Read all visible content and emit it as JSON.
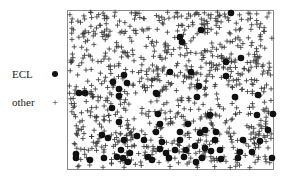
{
  "chart_data": {
    "type": "scatter",
    "title": "",
    "xlabel": "",
    "ylabel": "",
    "grid": false,
    "legend_position": "left",
    "plot_box": {
      "left": 67,
      "top": 10,
      "right": 274,
      "bottom": 170
    },
    "series": [
      {
        "name": "ECL",
        "marker": "filled-circle",
        "color": "#111111",
        "points": [
          [
            231,
            13
          ],
          [
            201,
            30
          ],
          [
            180,
            37
          ],
          [
            182,
            42
          ],
          [
            241,
            58
          ],
          [
            226,
            62
          ],
          [
            191,
            72
          ],
          [
            170,
            72
          ],
          [
            226,
            76
          ],
          [
            124,
            75
          ],
          [
            113,
            82
          ],
          [
            127,
            83
          ],
          [
            199,
            86
          ],
          [
            119,
            89
          ],
          [
            79,
            93
          ],
          [
            85,
            93
          ],
          [
            156,
            93
          ],
          [
            119,
            96
          ],
          [
            157,
            94
          ],
          [
            197,
            97
          ],
          [
            235,
            97
          ],
          [
            258,
            95
          ],
          [
            273,
            114
          ],
          [
            112,
            108
          ],
          [
            158,
            114
          ],
          [
            210,
            115
          ],
          [
            257,
            115
          ],
          [
            119,
            122
          ],
          [
            160,
            124
          ],
          [
            188,
            124
          ],
          [
            268,
            130
          ],
          [
            102,
            135
          ],
          [
            108,
            138
          ],
          [
            137,
            136
          ],
          [
            156,
            132
          ],
          [
            180,
            132
          ],
          [
            200,
            133
          ],
          [
            205,
            130
          ],
          [
            216,
            132
          ],
          [
            124,
            140
          ],
          [
            144,
            140
          ],
          [
            162,
            142
          ],
          [
            180,
            140
          ],
          [
            215,
            140
          ],
          [
            243,
            140
          ],
          [
            260,
            141
          ],
          [
            121,
            150
          ],
          [
            130,
            153
          ],
          [
            160,
            149
          ],
          [
            166,
            153
          ],
          [
            175,
            150
          ],
          [
            186,
            150
          ],
          [
            195,
            146
          ],
          [
            205,
            148
          ],
          [
            211,
            151
          ],
          [
            220,
            150
          ],
          [
            240,
            152
          ],
          [
            252,
            152
          ],
          [
            76,
            154
          ],
          [
            104,
            158
          ],
          [
            117,
            157
          ],
          [
            123,
            158
          ],
          [
            148,
            157
          ],
          [
            169,
            158
          ],
          [
            184,
            157
          ],
          [
            202,
            158
          ],
          [
            221,
            159
          ],
          [
            238,
            158
          ],
          [
            272,
            158
          ],
          [
            76,
            158
          ],
          [
            152,
            160
          ],
          [
            128,
            162
          ],
          [
            196,
            162
          ],
          [
            90,
            160
          ]
        ]
      },
      {
        "name": "other",
        "marker": "plus",
        "color": "#333333",
        "count_approx": 900
      }
    ],
    "legend": [
      {
        "label": "ECL",
        "marker": "filled-circle"
      },
      {
        "label": "other",
        "marker": "plus"
      }
    ]
  },
  "legend": {
    "ecl_label": "ECL",
    "other_label": "other",
    "ecl_symbol": "●",
    "other_symbol": "+"
  }
}
